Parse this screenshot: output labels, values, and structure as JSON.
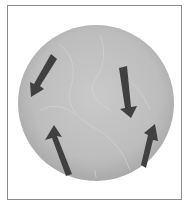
{
  "figure": {
    "colors": {
      "frame": "#8a8a8a",
      "globe": "#b9b9b9",
      "globe_texture": "#d2d2d2",
      "arrow": "#404040"
    },
    "arrows": [
      {
        "name": "upper-left-arrow",
        "direction": "down-left"
      },
      {
        "name": "upper-right-arrow",
        "direction": "down"
      },
      {
        "name": "lower-left-arrow",
        "direction": "up"
      },
      {
        "name": "lower-right-arrow",
        "direction": "up-right"
      }
    ]
  }
}
